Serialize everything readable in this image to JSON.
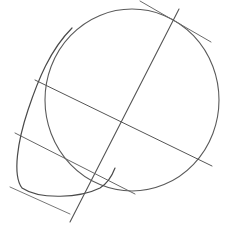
{
  "drawing": {
    "subject": "head construction sketch",
    "stroke_color": "#555555",
    "light_stroke_color": "#8a8a8a",
    "background": "#ffffff"
  }
}
